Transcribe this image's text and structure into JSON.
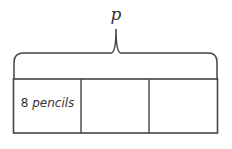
{
  "diagram": {
    "type": "tape-diagram",
    "total_label": "p",
    "parts": [
      {
        "value": "8",
        "unit": "pencils"
      },
      {
        "value": "",
        "unit": ""
      },
      {
        "value": "",
        "unit": ""
      }
    ],
    "stroke_color": "#444444"
  }
}
